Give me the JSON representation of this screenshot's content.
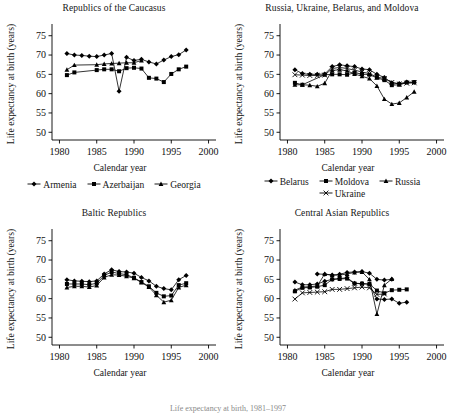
{
  "figure": {
    "caption_fragment": "Life expectancy at birth, 1981–1997"
  },
  "axis": {
    "xlabel": "Calendar year",
    "ylabel": "Life expectancy at birth (years)",
    "xticks": [
      1980,
      1985,
      1990,
      1995,
      2000
    ],
    "yticks": [
      50,
      55,
      60,
      65,
      70,
      75
    ],
    "xlim": [
      1979,
      2001
    ],
    "ylim": [
      48,
      77
    ]
  },
  "panels": [
    {
      "id": "caucasus",
      "title": "Republics of the Caucasus",
      "legend_rows": [
        [
          {
            "label": "Armenia",
            "marker": "diamond"
          },
          {
            "label": "Azerbaijan",
            "marker": "square"
          },
          {
            "label": "Georgia",
            "marker": "triangle"
          }
        ]
      ]
    },
    {
      "id": "slavic",
      "title": "Russia, Ukraine, Belarus, and Moldova",
      "legend_rows": [
        [
          {
            "label": "Belarus",
            "marker": "diamond"
          },
          {
            "label": "Moldova",
            "marker": "square"
          },
          {
            "label": "Russia",
            "marker": "triangle"
          }
        ],
        [
          {
            "label": "Ukraine",
            "marker": "cross"
          }
        ]
      ]
    },
    {
      "id": "baltic",
      "title": "Baltic Republics",
      "legend_rows": []
    },
    {
      "id": "centralasia",
      "title": "Central Asian Republics",
      "legend_rows": []
    }
  ],
  "chart_data": [
    {
      "id": "caucasus",
      "type": "line",
      "title": "Republics of the Caucasus",
      "xlabel": "Calendar year",
      "ylabel": "Life expectancy at birth (years)",
      "xlim": [
        1979,
        2001
      ],
      "ylim": [
        48,
        77
      ],
      "xticks": [
        1980,
        1985,
        1990,
        1995,
        2000
      ],
      "yticks": [
        50,
        55,
        60,
        65,
        70,
        75
      ],
      "grid": false,
      "legend_position": "below",
      "series": [
        {
          "name": "Armenia",
          "marker": "diamond",
          "x": [
            1981,
            1982,
            1983,
            1984,
            1985,
            1986,
            1987,
            1988,
            1989,
            1990,
            1991,
            1992,
            1993,
            1994,
            1995,
            1996,
            1997
          ],
          "values": [
            70.4,
            70.0,
            69.9,
            69.7,
            69.6,
            70.0,
            70.4,
            60.6,
            69.4,
            68.6,
            68.9,
            68.2,
            67.7,
            68.7,
            69.6,
            70.1,
            71.3
          ]
        },
        {
          "name": "Azerbaijan",
          "marker": "square",
          "x": [
            1981,
            1982,
            1985,
            1986,
            1987,
            1988,
            1989,
            1990,
            1991,
            1992,
            1993,
            1994,
            1995,
            1996,
            1997
          ],
          "values": [
            64.8,
            65.5,
            66.1,
            66.3,
            66.3,
            65.8,
            66.6,
            66.7,
            66.5,
            64.1,
            63.9,
            63.0,
            65.1,
            66.3,
            67.0
          ]
        },
        {
          "name": "Georgia",
          "marker": "triangle",
          "x": [
            1981,
            1982,
            1985,
            1986,
            1987,
            1988,
            1989,
            1990,
            1991
          ],
          "values": [
            66.2,
            67.4,
            67.5,
            67.7,
            67.8,
            67.9,
            68.0,
            68.0,
            68.6
          ]
        }
      ]
    },
    {
      "id": "slavic",
      "type": "line",
      "title": "Russia, Ukraine, Belarus, and Moldova",
      "xlabel": "Calendar year",
      "ylabel": "Life expectancy at birth (years)",
      "xlim": [
        1979,
        2001
      ],
      "ylim": [
        48,
        77
      ],
      "xticks": [
        1980,
        1985,
        1990,
        1995,
        2000
      ],
      "yticks": [
        50,
        55,
        60,
        65,
        70,
        75
      ],
      "grid": false,
      "legend_position": "below",
      "series": [
        {
          "name": "Belarus",
          "marker": "diamond",
          "x": [
            1981,
            1982,
            1983,
            1984,
            1985,
            1986,
            1987,
            1988,
            1989,
            1990,
            1991,
            1992,
            1993,
            1994,
            1995,
            1996,
            1997
          ],
          "values": [
            66.2,
            65.2,
            65.0,
            65.0,
            65.1,
            67.0,
            67.5,
            67.2,
            67.0,
            66.4,
            66.2,
            65.0,
            64.2,
            62.8,
            62.6,
            63.0,
            62.9
          ]
        },
        {
          "name": "Moldova",
          "marker": "square",
          "x": [
            1981,
            1982,
            1985,
            1986,
            1987,
            1988,
            1989,
            1990,
            1991,
            1992,
            1993,
            1994,
            1995,
            1996,
            1997
          ],
          "values": [
            62.8,
            62.3,
            64.9,
            65.0,
            65.0,
            64.9,
            65.4,
            65.1,
            64.9,
            64.1,
            63.5,
            62.2,
            62.3,
            62.9,
            63.0
          ]
        },
        {
          "name": "Russia",
          "marker": "triangle",
          "x": [
            1981,
            1982,
            1983,
            1984,
            1985,
            1986,
            1987,
            1988,
            1989,
            1990,
            1991,
            1992,
            1993,
            1994,
            1995,
            1996,
            1997
          ],
          "values": [
            62.3,
            62.3,
            62.2,
            61.9,
            62.7,
            66.0,
            66.2,
            65.9,
            65.1,
            64.5,
            63.9,
            62.0,
            58.6,
            57.3,
            57.6,
            59.0,
            60.5
          ]
        },
        {
          "name": "Ukraine",
          "marker": "cross",
          "x": [
            1981,
            1982,
            1983,
            1984,
            1985,
            1986,
            1987,
            1988,
            1989,
            1990,
            1991,
            1992,
            1993,
            1994,
            1995,
            1996,
            1997
          ],
          "values": [
            64.9,
            64.8,
            64.7,
            64.7,
            64.8,
            66.5,
            66.8,
            66.5,
            66.1,
            65.6,
            65.2,
            64.3,
            63.9,
            62.9,
            62.5,
            62.7,
            62.8
          ]
        }
      ]
    },
    {
      "id": "baltic",
      "type": "line",
      "title": "Baltic Republics",
      "xlabel": "Calendar year",
      "ylabel": "Life expectancy at birth (years)",
      "xlim": [
        1979,
        2001
      ],
      "ylim": [
        48,
        77
      ],
      "xticks": [
        1980,
        1985,
        1990,
        1995,
        2000
      ],
      "yticks": [
        50,
        55,
        60,
        65,
        70,
        75
      ],
      "grid": false,
      "legend_position": "none",
      "series": [
        {
          "name": "Estonia",
          "marker": "diamond",
          "x": [
            1981,
            1982,
            1983,
            1984,
            1985,
            1986,
            1987,
            1988,
            1989,
            1990,
            1991,
            1992,
            1993,
            1994,
            1995,
            1996,
            1997
          ],
          "values": [
            64.9,
            64.6,
            64.5,
            64.4,
            64.6,
            66.4,
            67.5,
            67.0,
            66.9,
            66.6,
            65.5,
            64.6,
            63.2,
            62.6,
            62.3,
            64.9,
            66.0
          ]
        },
        {
          "name": "Latvia",
          "marker": "square",
          "x": [
            1981,
            1982,
            1983,
            1984,
            1985,
            1986,
            1987,
            1988,
            1989,
            1990,
            1991,
            1992,
            1993,
            1994,
            1995,
            1996,
            1997
          ],
          "values": [
            63.8,
            63.8,
            63.8,
            63.6,
            64.0,
            66.0,
            66.9,
            66.5,
            66.2,
            65.4,
            64.3,
            63.2,
            61.5,
            60.6,
            60.8,
            63.5,
            64.0
          ]
        },
        {
          "name": "Lithuania",
          "marker": "triangle",
          "x": [
            1981,
            1982,
            1983,
            1984,
            1985,
            1986,
            1987,
            1988,
            1989,
            1990,
            1991,
            1992,
            1993,
            1994,
            1995,
            1996,
            1997
          ],
          "values": [
            62.9,
            63.2,
            63.2,
            63.0,
            63.4,
            65.5,
            66.2,
            66.1,
            65.8,
            65.3,
            64.2,
            63.0,
            60.9,
            59.1,
            59.6,
            62.9,
            63.5
          ]
        }
      ]
    },
    {
      "id": "centralasia",
      "type": "line",
      "title": "Central Asian Republics",
      "xlabel": "Calendar year",
      "ylabel": "Life expectancy at birth (years)",
      "xlim": [
        1979,
        2001
      ],
      "ylim": [
        48,
        77
      ],
      "xticks": [
        1980,
        1985,
        1990,
        1995,
        2000
      ],
      "yticks": [
        50,
        55,
        60,
        65,
        70,
        75
      ],
      "grid": false,
      "legend_position": "none",
      "series": [
        {
          "name": "Kazakhstan",
          "marker": "diamond",
          "x": [
            1981,
            1982,
            1983,
            1984,
            1985,
            1986,
            1987,
            1988,
            1989,
            1990,
            1991,
            1992,
            1993,
            1994,
            1995,
            1996
          ],
          "values": [
            64.3,
            63.6,
            63.6,
            63.8,
            64.5,
            65.0,
            65.2,
            65.4,
            64.0,
            63.9,
            63.7,
            59.9,
            59.8,
            59.9,
            58.8,
            59.1
          ]
        },
        {
          "name": "Kyrgyzstan",
          "marker": "square",
          "x": [
            1981,
            1982,
            1983,
            1984,
            1985,
            1986,
            1987,
            1988,
            1989,
            1990,
            1991,
            1992,
            1993,
            1994,
            1995,
            1996
          ],
          "values": [
            61.9,
            62.8,
            62.9,
            63.1,
            63.5,
            65.0,
            65.1,
            65.2,
            63.9,
            63.9,
            63.8,
            62.1,
            61.4,
            62.2,
            62.3,
            62.4
          ]
        },
        {
          "name": "Tajikistan",
          "marker": "triangle",
          "x": [
            1981,
            1982,
            1983,
            1984,
            1985,
            1986,
            1987,
            1988,
            1989,
            1990,
            1991,
            1992,
            1993,
            1994
          ],
          "values": [
            62.2,
            63.0,
            63.1,
            63.3,
            66.4,
            66.1,
            66.1,
            66.4,
            66.8,
            66.9,
            65.0,
            56.0,
            63.5,
            65.1
          ]
        },
        {
          "name": "Turkmenistan",
          "marker": "cross",
          "x": [
            1981,
            1982,
            1983,
            1984,
            1985,
            1986,
            1987,
            1988,
            1989,
            1990,
            1991,
            1992,
            1993
          ],
          "values": [
            59.9,
            61.5,
            61.6,
            61.7,
            61.8,
            62.4,
            62.4,
            62.6,
            62.8,
            63.0,
            62.8,
            61.1,
            61.2
          ]
        },
        {
          "name": "Uzbekistan",
          "marker": "diamond",
          "x": [
            1984,
            1985,
            1986,
            1987,
            1988,
            1989,
            1990,
            1991,
            1992,
            1993,
            1994
          ],
          "values": [
            66.4,
            66.3,
            66.1,
            66.3,
            66.8,
            66.9,
            67.0,
            66.6,
            65.0,
            64.8,
            65.0
          ]
        }
      ]
    }
  ]
}
